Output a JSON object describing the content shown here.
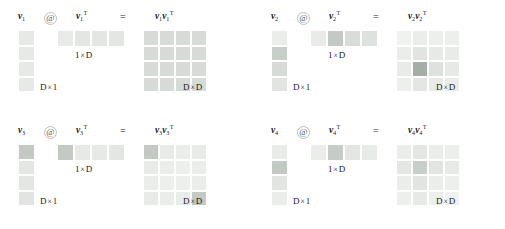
{
  "figure": {
    "operator_symbol": "@",
    "equals_symbol": "=",
    "transpose_mark": "T",
    "dim_col_label": "D × 1",
    "dim_row_label": "1 × D",
    "dim_out_label": "D × D",
    "dim_col": {
      "left": "D",
      "times": "×",
      "right": "1"
    },
    "dim_row": {
      "left": "1",
      "times": "×",
      "right": "D"
    },
    "dim_out": {
      "left": "D",
      "times": "×",
      "right": "D"
    },
    "vector_letter": "v",
    "colors": {
      "background": "#ffffff",
      "cell_base": "#edf2ed",
      "cell_light": "#f4f7f4",
      "cell_mid": "#dfe7df",
      "cell_dark": "#c3cec3",
      "cell_darkest": "#a8b5a8",
      "text": "#1a1a1a"
    }
  },
  "blocks": [
    {
      "id": "block-0",
      "index": 1,
      "col_label": "v",
      "col_sub": "1",
      "rowT_label": "v",
      "rowT_sub": "1",
      "out_label_a": "v",
      "out_sub_a": "1",
      "out_label_b": "v",
      "out_sub_b": "1",
      "colvec": [
        0.18,
        0.18,
        0.18,
        0.18
      ],
      "rowvec": [
        0.16,
        0.2,
        0.2,
        0.2
      ],
      "outmat": [
        [
          0.3,
          0.3,
          0.3,
          0.3
        ],
        [
          0.3,
          0.3,
          0.3,
          0.3
        ],
        [
          0.3,
          0.3,
          0.3,
          0.3
        ],
        [
          0.3,
          0.3,
          0.3,
          0.3
        ]
      ]
    },
    {
      "id": "block-1",
      "index": 2,
      "col_label": "v",
      "col_sub": "2",
      "rowT_label": "v",
      "rowT_sub": "2",
      "out_label_a": "v",
      "out_sub_a": "2",
      "out_label_b": "v",
      "out_sub_b": "2",
      "colvec": [
        0.14,
        0.42,
        0.3,
        0.22
      ],
      "rowvec": [
        0.16,
        0.46,
        0.28,
        0.24
      ],
      "outmat": [
        [
          0.1,
          0.14,
          0.12,
          0.12
        ],
        [
          0.14,
          0.22,
          0.18,
          0.16
        ],
        [
          0.16,
          0.7,
          0.24,
          0.18
        ],
        [
          0.12,
          0.2,
          0.16,
          0.14
        ]
      ]
    },
    {
      "id": "block-2",
      "index": 3,
      "col_label": "v",
      "col_sub": "3",
      "rowT_label": "v",
      "rowT_sub": "3",
      "out_label_a": "v",
      "out_sub_a": "3",
      "out_label_b": "v",
      "out_sub_b": "3",
      "colvec": [
        0.46,
        0.2,
        0.2,
        0.22
      ],
      "rowvec": [
        0.46,
        0.18,
        0.18,
        0.2
      ],
      "outmat": [
        [
          0.46,
          0.16,
          0.14,
          0.16
        ],
        [
          0.16,
          0.14,
          0.12,
          0.14
        ],
        [
          0.14,
          0.12,
          0.12,
          0.14
        ],
        [
          0.16,
          0.14,
          0.14,
          0.46
        ]
      ]
    },
    {
      "id": "block-3",
      "index": 4,
      "col_label": "v",
      "col_sub": "4",
      "rowT_label": "v",
      "rowT_sub": "4",
      "out_label_a": "v",
      "out_sub_a": "4",
      "out_label_b": "v",
      "out_sub_b": "4",
      "colvec": [
        0.16,
        0.46,
        0.22,
        0.14
      ],
      "rowvec": [
        0.14,
        0.44,
        0.2,
        0.16
      ],
      "outmat": [
        [
          0.14,
          0.2,
          0.14,
          0.12
        ],
        [
          0.2,
          0.42,
          0.22,
          0.18
        ],
        [
          0.14,
          0.22,
          0.14,
          0.12
        ],
        [
          0.12,
          0.18,
          0.12,
          0.1
        ]
      ]
    }
  ]
}
